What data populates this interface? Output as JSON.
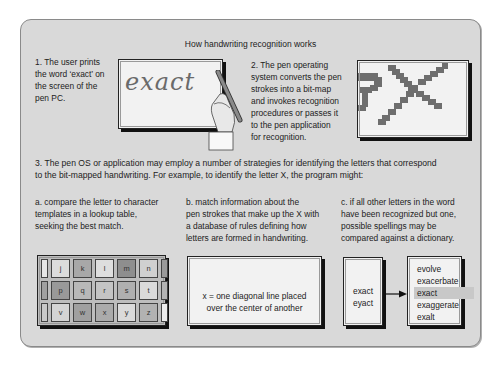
{
  "title": "How handwriting recognition works",
  "step1": {
    "lines": [
      "1.  The user prints",
      "the word ‘exact’ on",
      "the screen of the",
      "pen PC."
    ],
    "handwritten_word": "exact"
  },
  "step2": {
    "lines": [
      "2.  The pen operating",
      "system converts the pen",
      "strokes into a bit-map",
      "and invokes recognition",
      "procedures or passes it",
      "to the pen application",
      "for recognition."
    ]
  },
  "step3": {
    "lines": [
      "3.  The pen OS or application may employ a number of strategies for identifying the letters that correspond",
      "to the bit-mapped handwriting. For example, to identify the letter X, the program might:"
    ]
  },
  "strategies": {
    "a": {
      "lines": [
        "a.  compare the letter to character",
        "templates in a lookup table,",
        "seeking the best match."
      ],
      "lookup_table": {
        "rows": [
          [
            {
              "l": "",
              "c": "#e6e6e6"
            },
            {
              "l": "j",
              "c": "#dcdcdc"
            },
            {
              "l": "k",
              "c": "#a8a8a8"
            },
            {
              "l": "l",
              "c": "#dedede"
            },
            {
              "l": "m",
              "c": "#8e8e8e"
            },
            {
              "l": "n",
              "c": "#d0d0d0"
            },
            {
              "l": "",
              "c": "#9a9a9a"
            }
          ],
          [
            {
              "l": "",
              "c": "#a0a0a0"
            },
            {
              "l": "p",
              "c": "#999999"
            },
            {
              "l": "q",
              "c": "#b8b8b8"
            },
            {
              "l": "r",
              "c": "#c4c4c4"
            },
            {
              "l": "s",
              "c": "#b0b0b0"
            },
            {
              "l": "t",
              "c": "#dadada"
            },
            {
              "l": "",
              "c": "#b4b4b4"
            }
          ],
          [
            {
              "l": "",
              "c": "#c8c8c8"
            },
            {
              "l": "v",
              "c": "#d4d4d4"
            },
            {
              "l": "w",
              "c": "#a0a0a0"
            },
            {
              "l": "x",
              "c": "#ababab"
            },
            {
              "l": "y",
              "c": "#dadada"
            },
            {
              "l": "z",
              "c": "#b2b2b2"
            },
            {
              "l": "",
              "c": "#eeeeee"
            }
          ]
        ]
      }
    },
    "b": {
      "lines": [
        "b.  match information about the",
        "pen strokes that make up the X with",
        "a database of rules defining how",
        "letters are formed in handwriting."
      ],
      "rule_lines": [
        "x = one diagonal line placed",
        "over the center of another"
      ]
    },
    "c": {
      "lines": [
        "c.  if all other letters in the word",
        "have been recognized but one,",
        "possible spellings may be",
        "compared against a dictionary."
      ],
      "candidates": [
        "exact",
        "eyact"
      ],
      "dictionary": [
        "evolve",
        "exacerbate",
        "exact",
        "exaggerate",
        "exalt"
      ],
      "highlighted_index": 2
    }
  }
}
